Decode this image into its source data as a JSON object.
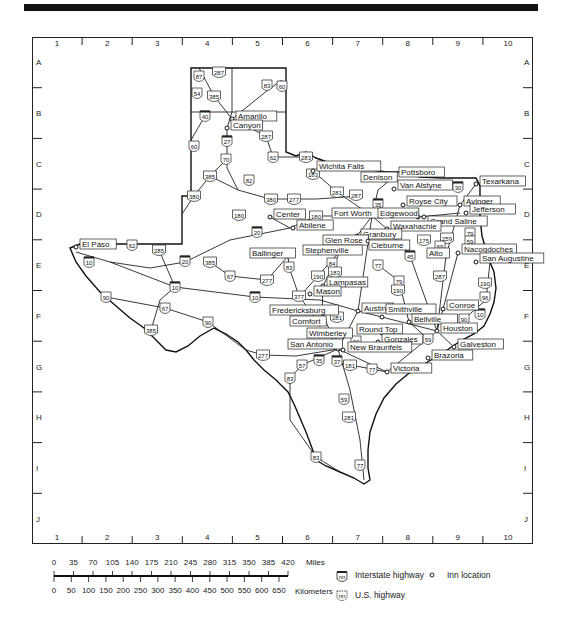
{
  "grid": {
    "columns": [
      "1",
      "2",
      "3",
      "4",
      "5",
      "6",
      "7",
      "8",
      "9",
      "10"
    ],
    "rows": [
      "A",
      "B",
      "C",
      "D",
      "E",
      "F",
      "G",
      "H",
      "I",
      "J"
    ]
  },
  "cities": [
    {
      "name": "Amarillo",
      "x": 232,
      "y": 119,
      "lx": 236,
      "ly": 115
    },
    {
      "name": "Canyon",
      "x": 227,
      "y": 128,
      "lx": 231,
      "ly": 124
    },
    {
      "name": "Wichita Falls",
      "x": 313,
      "y": 171,
      "lx": 317,
      "ly": 165
    },
    {
      "name": "Pottsboro",
      "x": 395,
      "y": 176,
      "lx": 399,
      "ly": 171
    },
    {
      "name": "Denison",
      "x": 385,
      "y": 180,
      "lx": 361,
      "ly": 176
    },
    {
      "name": "Van Alstyne",
      "x": 394,
      "y": 189,
      "lx": 398,
      "ly": 184
    },
    {
      "name": "Texarkana",
      "x": 476,
      "y": 184,
      "lx": 480,
      "ly": 180
    },
    {
      "name": "Royse City",
      "x": 403,
      "y": 205,
      "lx": 407,
      "ly": 200
    },
    {
      "name": "Avinger",
      "x": 460,
      "y": 205,
      "lx": 464,
      "ly": 200
    },
    {
      "name": "Jefferson",
      "x": 466,
      "y": 213,
      "lx": 470,
      "ly": 208
    },
    {
      "name": "Fort Worth",
      "x": 372,
      "y": 216,
      "lx": 332,
      "ly": 212
    },
    {
      "name": "Edgewood",
      "x": 418,
      "y": 217,
      "lx": 378,
      "ly": 212
    },
    {
      "name": "Grand Saline",
      "x": 424,
      "y": 217,
      "lx": 428,
      "ly": 220
    },
    {
      "name": "Center",
      "x": 270,
      "y": 217,
      "lx": 274,
      "ly": 213
    },
    {
      "name": "Abilene",
      "x": 293,
      "y": 228,
      "lx": 297,
      "ly": 224
    },
    {
      "name": "Waxahachie",
      "x": 387,
      "y": 229,
      "lx": 391,
      "ly": 225
    },
    {
      "name": "Granbury",
      "x": 357,
      "y": 236,
      "lx": 361,
      "ly": 233
    },
    {
      "name": "Glen Rose",
      "x": 343,
      "y": 240,
      "lx": 323,
      "ly": 239
    },
    {
      "name": "Cleburne",
      "x": 368,
      "y": 241,
      "lx": 369,
      "ly": 244
    },
    {
      "name": "El Paso",
      "x": 76,
      "y": 247,
      "lx": 80,
      "ly": 243
    },
    {
      "name": "Stephenville",
      "x": 341,
      "y": 250,
      "lx": 303,
      "ly": 249
    },
    {
      "name": "Alto",
      "x": 446,
      "y": 256,
      "lx": 427,
      "ly": 252
    },
    {
      "name": "Nacogdoches",
      "x": 458,
      "y": 253,
      "lx": 462,
      "ly": 248
    },
    {
      "name": "San Augustine",
      "x": 476,
      "y": 262,
      "lx": 480,
      "ly": 257
    },
    {
      "name": "Ballinger",
      "x": 288,
      "y": 256,
      "lx": 250,
      "ly": 252
    },
    {
      "name": "Lampasas",
      "x": 323,
      "y": 286,
      "lx": 327,
      "ly": 281
    },
    {
      "name": "Mason",
      "x": 310,
      "y": 294,
      "lx": 314,
      "ly": 290
    },
    {
      "name": "Fredericksburg",
      "x": 322,
      "y": 313,
      "lx": 270,
      "ly": 309
    },
    {
      "name": "Austin",
      "x": 358,
      "y": 311,
      "lx": 362,
      "ly": 307
    },
    {
      "name": "Smithville",
      "x": 382,
      "y": 317,
      "lx": 386,
      "ly": 308
    },
    {
      "name": "Conroe",
      "x": 443,
      "y": 309,
      "lx": 447,
      "ly": 304
    },
    {
      "name": "Bellville",
      "x": 409,
      "y": 322,
      "lx": 412,
      "ly": 318
    },
    {
      "name": "Comfort",
      "x": 320,
      "y": 324,
      "lx": 290,
      "ly": 320
    },
    {
      "name": "Round Top",
      "x": 382,
      "y": 333,
      "lx": 357,
      "ly": 328
    },
    {
      "name": "Houston",
      "x": 437,
      "y": 331,
      "lx": 441,
      "ly": 327
    },
    {
      "name": "Wimberley",
      "x": 334,
      "y": 339,
      "lx": 307,
      "ly": 332
    },
    {
      "name": "Gonzales",
      "x": 378,
      "y": 342,
      "lx": 382,
      "ly": 338
    },
    {
      "name": "Galveston",
      "x": 454,
      "y": 347,
      "lx": 458,
      "ly": 343
    },
    {
      "name": "San Antonio",
      "x": 338,
      "y": 349,
      "lx": 288,
      "ly": 343
    },
    {
      "name": "New Braunfels",
      "x": 343,
      "y": 350,
      "lx": 348,
      "ly": 346
    },
    {
      "name": "Brazoria",
      "x": 428,
      "y": 358,
      "lx": 432,
      "ly": 354
    },
    {
      "name": "Victoria",
      "x": 387,
      "y": 372,
      "lx": 391,
      "ly": 367
    }
  ],
  "interstates": [
    {
      "n": "40",
      "x": 205,
      "y": 116
    },
    {
      "n": "27",
      "x": 227,
      "y": 141
    },
    {
      "n": "20",
      "x": 257,
      "y": 232
    },
    {
      "n": "20",
      "x": 185,
      "y": 261
    },
    {
      "n": "10",
      "x": 89,
      "y": 262
    },
    {
      "n": "10",
      "x": 175,
      "y": 287
    },
    {
      "n": "10",
      "x": 255,
      "y": 297
    },
    {
      "n": "35",
      "x": 378,
      "y": 204
    },
    {
      "n": "30",
      "x": 458,
      "y": 187
    },
    {
      "n": "45",
      "x": 410,
      "y": 256
    },
    {
      "n": "35",
      "x": 319,
      "y": 360
    },
    {
      "n": "37",
      "x": 337,
      "y": 361
    },
    {
      "n": "10",
      "x": 480,
      "y": 314
    }
  ],
  "us_highways": [
    {
      "n": "87",
      "x": 199,
      "y": 76
    },
    {
      "n": "287",
      "x": 219,
      "y": 72
    },
    {
      "n": "54",
      "x": 197,
      "y": 93
    },
    {
      "n": "385",
      "x": 214,
      "y": 96
    },
    {
      "n": "83",
      "x": 267,
      "y": 85
    },
    {
      "n": "60",
      "x": 282,
      "y": 86
    },
    {
      "n": "60",
      "x": 194,
      "y": 146
    },
    {
      "n": "287",
      "x": 266,
      "y": 136
    },
    {
      "n": "70",
      "x": 226,
      "y": 159
    },
    {
      "n": "62",
      "x": 273,
      "y": 157
    },
    {
      "n": "283",
      "x": 306,
      "y": 157
    },
    {
      "n": "183",
      "x": 313,
      "y": 174
    },
    {
      "n": "385",
      "x": 210,
      "y": 176
    },
    {
      "n": "82",
      "x": 249,
      "y": 180
    },
    {
      "n": "281",
      "x": 337,
      "y": 192
    },
    {
      "n": "287",
      "x": 356,
      "y": 195
    },
    {
      "n": "277",
      "x": 294,
      "y": 199
    },
    {
      "n": "380",
      "x": 194,
      "y": 196
    },
    {
      "n": "380",
      "x": 271,
      "y": 199
    },
    {
      "n": "180",
      "x": 239,
      "y": 215
    },
    {
      "n": "180",
      "x": 316,
      "y": 216
    },
    {
      "n": "175",
      "x": 424,
      "y": 240
    },
    {
      "n": "259",
      "x": 447,
      "y": 238
    },
    {
      "n": "79",
      "x": 470,
      "y": 233
    },
    {
      "n": "59",
      "x": 470,
      "y": 241
    },
    {
      "n": "62",
      "x": 132,
      "y": 245
    },
    {
      "n": "285",
      "x": 159,
      "y": 250
    },
    {
      "n": "385",
      "x": 210,
      "y": 262
    },
    {
      "n": "67",
      "x": 230,
      "y": 276
    },
    {
      "n": "83",
      "x": 289,
      "y": 267
    },
    {
      "n": "277",
      "x": 267,
      "y": 280
    },
    {
      "n": "84",
      "x": 332,
      "y": 263
    },
    {
      "n": "183",
      "x": 335,
      "y": 272
    },
    {
      "n": "190",
      "x": 318,
      "y": 276
    },
    {
      "n": "77",
      "x": 378,
      "y": 265
    },
    {
      "n": "69",
      "x": 440,
      "y": 246
    },
    {
      "n": "287",
      "x": 440,
      "y": 276
    },
    {
      "n": "79",
      "x": 399,
      "y": 281
    },
    {
      "n": "190",
      "x": 398,
      "y": 290
    },
    {
      "n": "190",
      "x": 485,
      "y": 283
    },
    {
      "n": "96",
      "x": 485,
      "y": 297
    },
    {
      "n": "377",
      "x": 299,
      "y": 296
    },
    {
      "n": "281",
      "x": 337,
      "y": 317
    },
    {
      "n": "90",
      "x": 106,
      "y": 297
    },
    {
      "n": "67",
      "x": 165,
      "y": 308
    },
    {
      "n": "90",
      "x": 208,
      "y": 322
    },
    {
      "n": "385",
      "x": 151,
      "y": 330
    },
    {
      "n": "277",
      "x": 263,
      "y": 355
    },
    {
      "n": "90",
      "x": 356,
      "y": 341
    },
    {
      "n": "59",
      "x": 428,
      "y": 339
    },
    {
      "n": "90",
      "x": 464,
      "y": 319
    },
    {
      "n": "181",
      "x": 350,
      "y": 365
    },
    {
      "n": "77",
      "x": 372,
      "y": 369
    },
    {
      "n": "57",
      "x": 302,
      "y": 365
    },
    {
      "n": "83",
      "x": 290,
      "y": 378
    },
    {
      "n": "59",
      "x": 344,
      "y": 399
    },
    {
      "n": "281",
      "x": 349,
      "y": 417
    },
    {
      "n": "83",
      "x": 316,
      "y": 457
    },
    {
      "n": "77",
      "x": 360,
      "y": 465
    }
  ],
  "scale": {
    "miles_label": "Miles",
    "km_label": "Kilometers",
    "miles_ticks": [
      "0",
      "35",
      "70",
      "105",
      "140",
      "175",
      "210",
      "245",
      "280",
      "315",
      "350",
      "385",
      "420"
    ],
    "km_ticks": [
      "0",
      "50",
      "100",
      "150",
      "200",
      "250",
      "300",
      "350",
      "400",
      "450",
      "500",
      "550",
      "600",
      "650"
    ]
  },
  "legend": {
    "interstate_label": "Interstate highway",
    "us_highway_label": "U.S. highway",
    "inn_label": "Inn location",
    "shield_text": "nn"
  }
}
